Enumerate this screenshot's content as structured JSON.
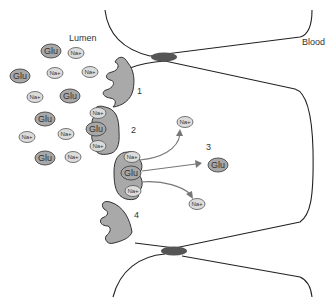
{
  "diagram": {
    "title": "",
    "regions": {
      "lumen_label": "Lumen",
      "blood_label": "Blood"
    },
    "steps": [
      "1",
      "2",
      "3",
      "4"
    ],
    "molecules": {
      "glucose_label": "Glu",
      "sodium_label": "Na+"
    },
    "colors": {
      "transporter": "#a9a9a9",
      "glucose": "#a8a8a8",
      "sodium": "#dcdcdc",
      "membrane": "#222222",
      "junction": "#555555",
      "arrow": "#777777"
    },
    "lumen_molecules": [
      {
        "type": "Glu",
        "x": 51,
        "y": 51
      },
      {
        "type": "Na+",
        "x": 76,
        "y": 53
      },
      {
        "type": "Glu",
        "x": 20,
        "y": 76
      },
      {
        "type": "Na+",
        "x": 55,
        "y": 73
      },
      {
        "type": "Na+",
        "x": 90,
        "y": 72
      },
      {
        "type": "Na+",
        "x": 35,
        "y": 97
      },
      {
        "type": "Glu",
        "x": 70,
        "y": 96
      },
      {
        "type": "Glu",
        "x": 45,
        "y": 119
      },
      {
        "type": "Na+",
        "x": 27,
        "y": 137
      },
      {
        "type": "Na+",
        "x": 66,
        "y": 134
      },
      {
        "type": "Glu",
        "x": 45,
        "y": 158
      },
      {
        "type": "Na+",
        "x": 73,
        "y": 157
      }
    ],
    "transporter_2_cargo": [
      {
        "type": "Na+",
        "x": 98,
        "y": 113
      },
      {
        "type": "Glu",
        "x": 96,
        "y": 129
      },
      {
        "type": "Na+",
        "x": 98,
        "y": 146
      }
    ],
    "transporter_3_cargo": [
      {
        "type": "Na+",
        "x": 132,
        "y": 157
      },
      {
        "type": "Glu",
        "x": 131,
        "y": 173
      },
      {
        "type": "Na+",
        "x": 133,
        "y": 191
      }
    ],
    "released": [
      {
        "type": "Na+",
        "x": 185,
        "y": 122
      },
      {
        "type": "Glu",
        "x": 218,
        "y": 165
      },
      {
        "type": "Na+",
        "x": 197,
        "y": 204
      }
    ]
  }
}
